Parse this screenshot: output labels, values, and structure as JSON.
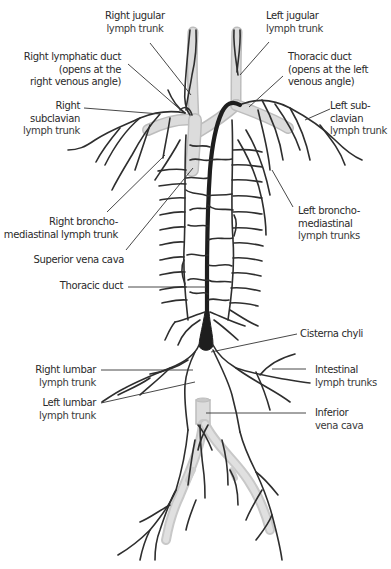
{
  "diagram": {
    "colors": {
      "lymph_vessel": "#2e2e2e",
      "thoracic_duct": "#1e1e1e",
      "veins": "#d6d6d6",
      "vein_edge": "#bdbdbd",
      "leader_line": "#333333",
      "text": "#2a2a2a",
      "background": "#ffffff"
    },
    "labels": {
      "right_jugular": {
        "line1": "Right jugular",
        "line2": "lymph trunk"
      },
      "left_jugular": {
        "line1": "Left jugular",
        "line2": "lymph trunk"
      },
      "right_lymphatic_duct": {
        "line1": "Right lymphatic duct",
        "line2": "(opens at the",
        "line3": "right venous angle)"
      },
      "thoracic_duct_top": {
        "line1": "Thoracic duct",
        "line2": "(opens at the left",
        "line3": "venous angle)"
      },
      "right_subclavian": {
        "line1": "Right",
        "line2": "subclavian",
        "line3": "lymph trunk"
      },
      "left_subclavian": {
        "line1": "Left sub-",
        "line2": "clavian",
        "line3": "lymph trunk"
      },
      "right_bronchomediastinal": {
        "line1": "Right broncho-",
        "line2": "mediastinal lymph trunk"
      },
      "left_bronchomediastinal": {
        "line1": "Left broncho-",
        "line2": "mediastinal",
        "line3": "lymph trunks"
      },
      "superior_vena_cava": {
        "line1": "Superior vena cava"
      },
      "thoracic_duct_mid": {
        "line1": "Thoracic duct"
      },
      "cisterna_chyli": {
        "line1": "Cisterna chyli"
      },
      "right_lumbar": {
        "line1": "Right lumbar",
        "line2": "lymph trunk"
      },
      "left_lumbar": {
        "line1": "Left lumbar",
        "line2": "lymph trunk"
      },
      "intestinal": {
        "line1": "Intestinal",
        "line2": "lymph trunks"
      },
      "inferior_vena_cava": {
        "line1": "Inferior",
        "line2": "vena cava"
      }
    }
  }
}
